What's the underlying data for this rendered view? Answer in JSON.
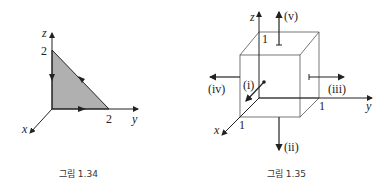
{
  "figures": [
    {
      "caption": "그림 1.34",
      "axes": {
        "x": "x",
        "y": "y",
        "z": "z"
      },
      "labels": {
        "z_intercept": "2",
        "y_intercept": "2"
      },
      "shape": "triangle in yz-plane with vertices (0,0,0), (0,2,0), (0,0,2)",
      "fill_color": "#b0b0b0"
    },
    {
      "caption": "그림 1.35",
      "axes": {
        "x": "x",
        "y": "y",
        "z": "z"
      },
      "labels": {
        "x_tick": "1",
        "y_tick": "1",
        "z_tick": "1"
      },
      "arrows": [
        "(i)",
        "(ii)",
        "(iii)",
        "(iv)",
        "(v)"
      ]
    }
  ]
}
